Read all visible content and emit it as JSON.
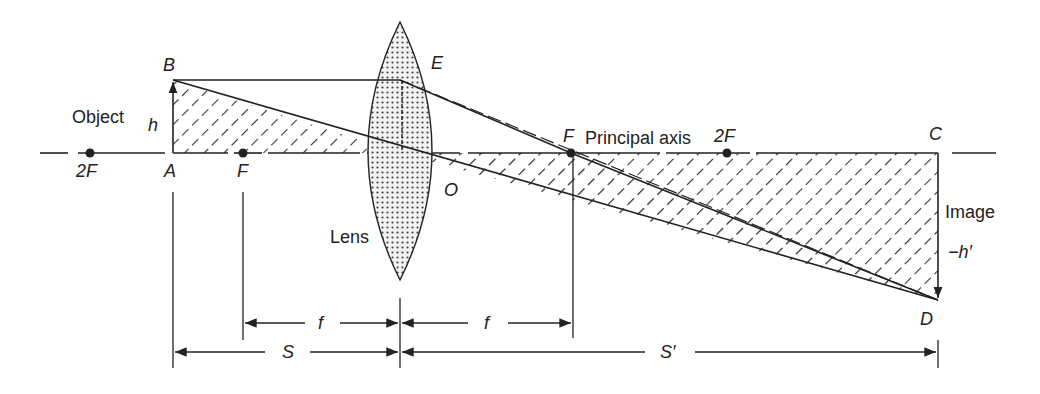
{
  "diagram": {
    "points": {
      "B": "B",
      "A": "A",
      "E": "E",
      "O": "O",
      "C": "C",
      "D": "D",
      "F_left": "F",
      "F_right": "F",
      "twoF_left": "2F",
      "twoF_right": "2F"
    },
    "labels": {
      "object": "Object",
      "h": "h",
      "principal_axis": "Principal axis",
      "lens": "Lens",
      "image": "Image",
      "neg_h_prime": "−h′"
    },
    "dimensions": {
      "f_left": "f",
      "f_right": "f",
      "S": "S",
      "S_prime": "S′"
    },
    "colors": {
      "line": "#222222",
      "hatch": "#333333",
      "lens_fill": "#e8e8e8",
      "lens_dots": "#444444"
    }
  }
}
